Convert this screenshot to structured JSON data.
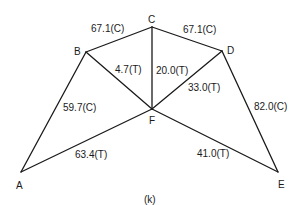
{
  "diagram": {
    "type": "truss",
    "caption": "(k)",
    "nodes": [
      {
        "id": "A",
        "label": "A",
        "x": 21,
        "y": 172,
        "lx": 16,
        "ly": 189
      },
      {
        "id": "B",
        "label": "B",
        "x": 86,
        "y": 52,
        "lx": 74,
        "ly": 55
      },
      {
        "id": "C",
        "label": "C",
        "x": 152,
        "y": 27,
        "lx": 148,
        "ly": 23
      },
      {
        "id": "D",
        "label": "D",
        "x": 222,
        "y": 51,
        "lx": 227,
        "ly": 54
      },
      {
        "id": "E",
        "label": "E",
        "x": 278,
        "y": 172,
        "lx": 278,
        "ly": 188
      },
      {
        "id": "F",
        "label": "F",
        "x": 152,
        "y": 109,
        "lx": 149,
        "ly": 124
      }
    ],
    "members": [
      {
        "from": "A",
        "to": "B",
        "force": "59.7(C)",
        "lx": 63,
        "ly": 111
      },
      {
        "from": "B",
        "to": "C",
        "force": "67.1(C)",
        "lx": 91,
        "ly": 32
      },
      {
        "from": "C",
        "to": "D",
        "force": "67.1(C)",
        "lx": 183,
        "ly": 33
      },
      {
        "from": "D",
        "to": "E",
        "force": "82.0(C)",
        "lx": 254,
        "ly": 110
      },
      {
        "from": "A",
        "to": "F",
        "force": "63.4(T)",
        "lx": 75,
        "ly": 158
      },
      {
        "from": "F",
        "to": "E",
        "force": "41.0(T)",
        "lx": 197,
        "ly": 157
      },
      {
        "from": "B",
        "to": "F",
        "force": "4.7(T)",
        "lx": 115,
        "ly": 73
      },
      {
        "from": "C",
        "to": "F",
        "force": "20.0(T)",
        "lx": 156,
        "ly": 74
      },
      {
        "from": "D",
        "to": "F",
        "force": "33.0(T)",
        "lx": 188,
        "ly": 91
      }
    ]
  }
}
